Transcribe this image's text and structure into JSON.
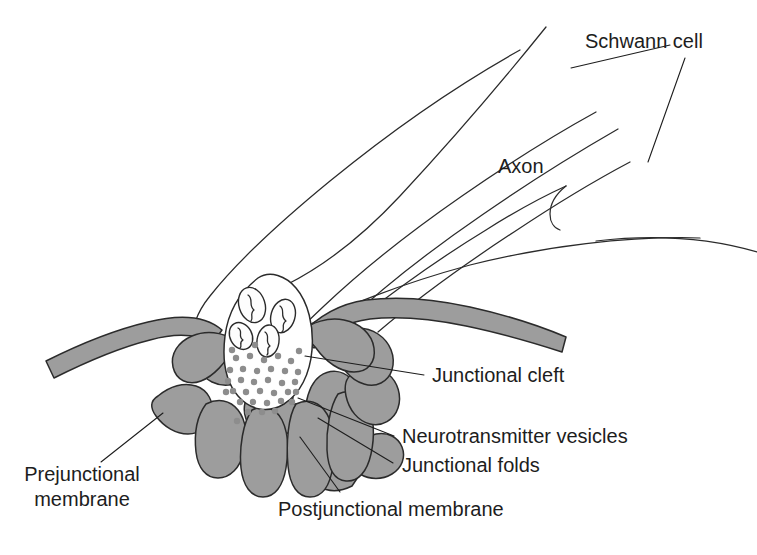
{
  "figure": {
    "background_color": "#ffffff",
    "line_color": "#2b2b2b",
    "membrane_fill_color": "#9d9d9d",
    "vesicle_color": "#8d8d8d",
    "text_color": "#1d1d1d",
    "width": 757,
    "height": 555
  },
  "labels": {
    "schwann_cell": "Schwann cell",
    "axon": "Axon",
    "junctional_cleft": "Junctional cleft",
    "neurotransmitter_vesicles": "Neurotransmitter vesicles",
    "junctional_folds": "Junctional folds",
    "prejunctional_membrane_line1": "Prejunctional",
    "prejunctional_membrane_line2": "membrane",
    "postjunctional_membrane": "Postjunctional membrane"
  },
  "structures": {
    "nerve_fiber": "myelinated nerve fiber descending from upper right",
    "nerve_terminal": "synaptic bouton containing vesicles and mitochondria",
    "mitochondria_count": 4,
    "vesicle_count": 36,
    "junctional_fold_count": 7
  }
}
